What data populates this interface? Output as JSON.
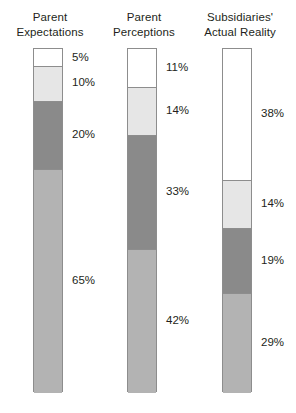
{
  "chart_data": {
    "type": "bar",
    "subtype": "stacked-100-percent",
    "title": "",
    "xlabel": "",
    "ylabel": "",
    "ylim": [
      0,
      100
    ],
    "grid": false,
    "legend": "none",
    "value_suffix": "%",
    "categories": [
      "Parent Expectations",
      "Parent Perceptions",
      "Subsidiaries' Actual Reality"
    ],
    "segment_order": "top-to-bottom",
    "series": [
      {
        "name": "white",
        "color": "#ffffff",
        "values": [
          5,
          11,
          38
        ]
      },
      {
        "name": "light-gray",
        "color": "#e6e6e6",
        "values": [
          10,
          14,
          14
        ]
      },
      {
        "name": "dark-gray",
        "color": "#8a8a8a",
        "values": [
          20,
          33,
          19
        ]
      },
      {
        "name": "medium-gray",
        "color": "#b3b3b3",
        "values": [
          65,
          42,
          29
        ]
      }
    ],
    "columns": [
      {
        "title": "Parent\nExpectations",
        "segments": [
          {
            "label": "5%",
            "value": 5,
            "color": "#ffffff"
          },
          {
            "label": "10%",
            "value": 10,
            "color": "#e6e6e6"
          },
          {
            "label": "20%",
            "value": 20,
            "color": "#8a8a8a"
          },
          {
            "label": "65%",
            "value": 65,
            "color": "#b3b3b3"
          }
        ]
      },
      {
        "title": "Parent\nPerceptions",
        "segments": [
          {
            "label": "11%",
            "value": 11,
            "color": "#ffffff"
          },
          {
            "label": "14%",
            "value": 14,
            "color": "#e6e6e6"
          },
          {
            "label": "33%",
            "value": 33,
            "color": "#8a8a8a"
          },
          {
            "label": "42%",
            "value": 42,
            "color": "#b3b3b3"
          }
        ]
      },
      {
        "title": "Subsidiaries'\nActual Reality",
        "segments": [
          {
            "label": "38%",
            "value": 38,
            "color": "#ffffff"
          },
          {
            "label": "14%",
            "value": 14,
            "color": "#e6e6e6"
          },
          {
            "label": "19%",
            "value": 19,
            "color": "#8a8a8a"
          },
          {
            "label": "29%",
            "value": 29,
            "color": "#b3b3b3"
          }
        ]
      }
    ],
    "colors": {
      "outline": "#8d8d8d",
      "text": "#231f20",
      "white": "#ffffff",
      "light_gray": "#e6e6e6",
      "dark_gray": "#8a8a8a",
      "medium_gray": "#b3b3b3",
      "background": "#ffffff"
    }
  }
}
